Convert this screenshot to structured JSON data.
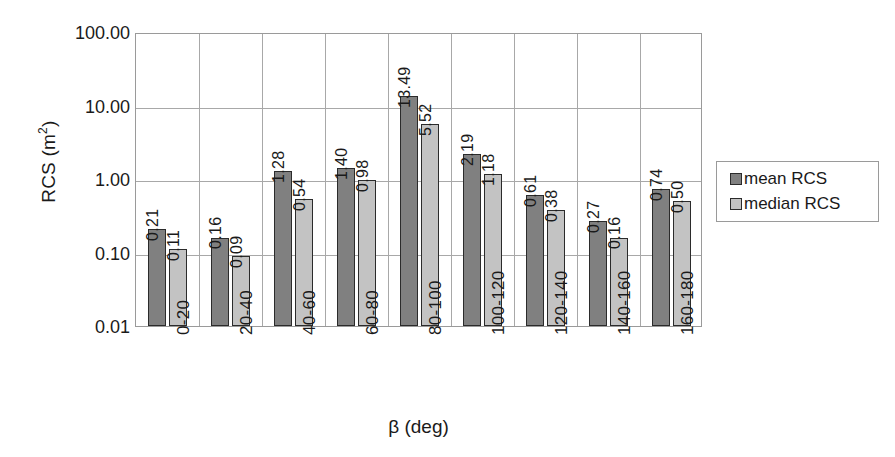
{
  "chart_data": {
    "type": "bar",
    "title": "",
    "xlabel": "β (deg)",
    "ylabel": "RCS (m²)",
    "ylabel_base": "RCS (m",
    "ylabel_sup": "2",
    "ylabel_tail": ")",
    "yscale": "log",
    "ylim": [
      0.01,
      100
    ],
    "grid": "horizontal-and-vertical",
    "legend_position": "right",
    "categories": [
      "0-20",
      "20-40",
      "40-60",
      "60-80",
      "80-100",
      "100-120",
      "120-140",
      "140-160",
      "160-180"
    ],
    "y_ticks": [
      "100.00",
      "10.00",
      "1.00",
      "0.10",
      "0.01"
    ],
    "y_tick_values": [
      100,
      10,
      1,
      0.1,
      0.01
    ],
    "series": [
      {
        "name": "mean RCS",
        "color": "#808080",
        "values": [
          0.21,
          0.16,
          1.28,
          1.4,
          13.49,
          2.19,
          0.61,
          0.27,
          0.74
        ],
        "labels": [
          "0.21",
          "0.16",
          "1.28",
          "1.40",
          "13.49",
          "2.19",
          "0.61",
          "0.27",
          "0.74"
        ]
      },
      {
        "name": "median RCS",
        "color": "#c3c3c3",
        "values": [
          0.11,
          0.09,
          0.54,
          0.98,
          5.52,
          1.18,
          0.38,
          0.16,
          0.5
        ],
        "labels": [
          "0.11",
          "0.09",
          "0.54",
          "0.98",
          "5.52",
          "1.18",
          "0.38",
          "0.16",
          "0.50"
        ]
      }
    ]
  },
  "legend": {
    "items": [
      {
        "label": "mean RCS",
        "color": "#808080"
      },
      {
        "label": "median RCS",
        "color": "#c3c3c3"
      }
    ]
  }
}
